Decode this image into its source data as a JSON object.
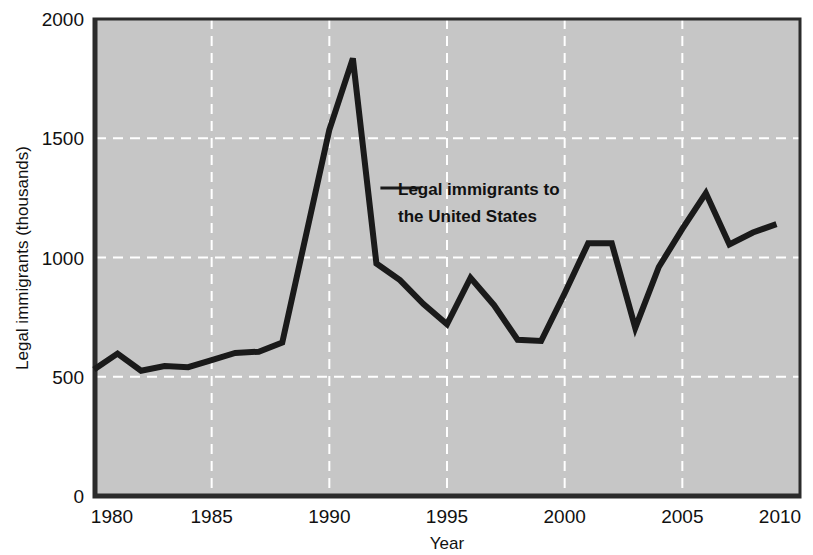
{
  "chart_data": {
    "type": "line",
    "title": "",
    "xlabel": "Year",
    "ylabel": "Legal immigrants (thousands)",
    "xlim": [
      1980,
      2010
    ],
    "ylim": [
      0,
      2000
    ],
    "xticks": [
      "1980",
      "1985",
      "1990",
      "1995",
      "2000",
      "2005",
      "2010"
    ],
    "yticks": [
      "0",
      "500",
      "1000",
      "1500",
      "2000"
    ],
    "grid": "dashed-white-major",
    "legend": "none",
    "plot_background": "#c6c6c6",
    "line_color": "#1a1a1a",
    "annotations": [
      {
        "name": "series-callout",
        "text_line1": "Legal immigrants to",
        "text_line2": "the United States",
        "points_to_year": 1992
      }
    ],
    "series": [
      {
        "name": "Legal immigrants to the United States",
        "x": [
          1980,
          1981,
          1982,
          1983,
          1984,
          1985,
          1986,
          1987,
          1988,
          1989,
          1990,
          1991,
          1992,
          1993,
          1994,
          1995,
          1996,
          1997,
          1998,
          1999,
          2000,
          2001,
          2002,
          2003,
          2004,
          2005,
          2006,
          2007,
          2008,
          2009
        ],
        "values": [
          530,
          597,
          525,
          545,
          540,
          570,
          600,
          605,
          643,
          1090,
          1535,
          1835,
          975,
          905,
          805,
          720,
          915,
          800,
          655,
          650,
          850,
          1060,
          1060,
          705,
          960,
          1120,
          1270,
          1055,
          1105,
          1140
        ]
      }
    ]
  }
}
